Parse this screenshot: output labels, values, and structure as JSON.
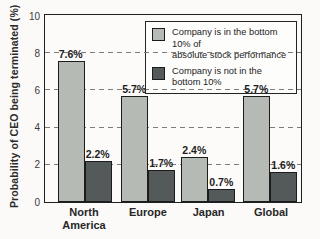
{
  "chart_data": {
    "type": "bar",
    "title": "",
    "ylabel": "Probability of CEO being terminated (%)",
    "xlabel": "",
    "categories": [
      "North America",
      "Europe",
      "Japan",
      "Global"
    ],
    "series": [
      {
        "name": "Company is in the bottom 10% of absolute stock performance",
        "values": [
          7.6,
          5.7,
          2.4,
          5.7
        ],
        "labels": [
          "7.6%",
          "5.7%",
          "2.4%",
          "5.7%"
        ],
        "color": "#b6bab5"
      },
      {
        "name": "Company is not in the bottom 10%",
        "values": [
          2.2,
          1.7,
          0.7,
          1.6
        ],
        "labels": [
          "2.2%",
          "1.7%",
          "0.7%",
          "1.6%"
        ],
        "color": "#54595a"
      }
    ],
    "ylim": [
      0,
      10
    ],
    "yticks": [
      0,
      2,
      4,
      6,
      8,
      10
    ],
    "gridlines_at": [
      2,
      4,
      6,
      8
    ],
    "grid_style": "horizontal dashed",
    "legend_position": "top-right inside plot",
    "value_label_format": "{value}%"
  },
  "legend": {
    "items": [
      {
        "label": "Company is in the bottom 10% of\nabsolute stock performance",
        "color": "#b6bab5"
      },
      {
        "label": "Company is not in the\nbottom 10%",
        "color": "#54595a"
      }
    ]
  },
  "colors": {
    "series_light": "#b6bab5",
    "series_dark": "#54595a",
    "frame": "#1f1f1f",
    "gridline": "#7c7c7c",
    "background": "#fbfaf8"
  }
}
